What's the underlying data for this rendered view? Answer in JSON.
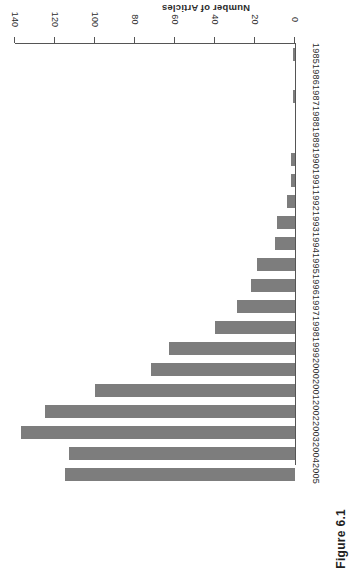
{
  "figure": {
    "caption": "Figure 6.1"
  },
  "chart_data": {
    "type": "bar",
    "orientation": "horizontal",
    "title": "",
    "xlabel": "Number of Articles",
    "ylabel": "",
    "categories": [
      "1985",
      "1986",
      "1987",
      "1988",
      "1989",
      "1990",
      "1991",
      "1992",
      "1993",
      "1994",
      "1995",
      "1996",
      "1997",
      "1998",
      "1999",
      "2000",
      "2001",
      "2002",
      "2003",
      "2004",
      "2005"
    ],
    "values": [
      1,
      0,
      1,
      0,
      0,
      2,
      2,
      4,
      9,
      10,
      19,
      22,
      29,
      40,
      63,
      72,
      100,
      125,
      137,
      113,
      115
    ],
    "tick_labels": [
      "0",
      "20",
      "40",
      "60",
      "80",
      "100",
      "120",
      "140"
    ],
    "ticks": [
      0,
      20,
      40,
      60,
      80,
      100,
      120,
      140
    ],
    "xlim": [
      0,
      140
    ],
    "grid": false,
    "legend": false,
    "bar_color": "#7d7d7d",
    "axis_color": "#555555"
  }
}
